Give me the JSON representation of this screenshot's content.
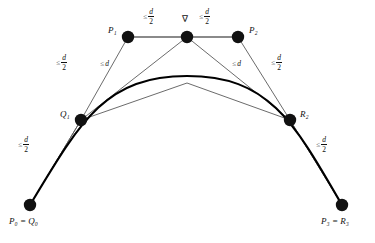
{
  "figure": {
    "kind": "bezier-subdivision-diagram",
    "background": "#ffffff",
    "stroke_thin": "#555555",
    "stroke_hull": "#8a8a8a",
    "stroke_curve": "#000000",
    "node_fill": "#111111",
    "width": 375,
    "height": 243
  },
  "points": [
    {
      "id": "P0Q0",
      "label": "P",
      "sub": "0",
      "label2": "Q",
      "sub2": "0",
      "text": "P₀ = Q₀",
      "x": 30,
      "y": 205,
      "r": 6.2,
      "label_pos": "below"
    },
    {
      "id": "Q1",
      "label": "Q",
      "sub": "1",
      "text": "Q₁",
      "x": 81,
      "y": 120,
      "r": 6.2,
      "label_pos": "left"
    },
    {
      "id": "P1",
      "label": "P",
      "sub": "1",
      "text": "P₁",
      "x": 128,
      "y": 37,
      "r": 6.2,
      "label_pos": "left"
    },
    {
      "id": "APEX",
      "label": "∇",
      "sub": "",
      "text": "∇",
      "x": 187,
      "y": 37,
      "r": 6.2,
      "label_pos": "above"
    },
    {
      "id": "P2",
      "label": "P",
      "sub": "2",
      "text": "P₂",
      "x": 238,
      "y": 37,
      "r": 6.2,
      "label_pos": "right"
    },
    {
      "id": "R2",
      "label": "R",
      "sub": "2",
      "text": "R₂",
      "x": 290,
      "y": 120,
      "r": 6.2,
      "label_pos": "right"
    },
    {
      "id": "P3R3",
      "label": "P",
      "sub": "3",
      "label2": "R",
      "sub2": "3",
      "text": "P₃ = R₃",
      "x": 342,
      "y": 205,
      "r": 6.2,
      "label_pos": "below"
    }
  ],
  "point_labels": {
    "p0q0": "P₀ = Q₀",
    "q1": "Q₁",
    "p1": "P₁",
    "apex": "∇",
    "p2": "P₂",
    "r2": "R₂",
    "p3r3": "P₃ = R₃"
  },
  "measures": [
    {
      "id": "m-p1-apex",
      "relation": "≤",
      "numerator": "d",
      "denominator": "2",
      "form": "fraction",
      "text": "≤ d/2",
      "x": 148,
      "y": 14
    },
    {
      "id": "m-apex-p2",
      "relation": "≤",
      "numerator": "d",
      "denominator": "2",
      "form": "fraction",
      "text": "≤ d/2",
      "x": 203,
      "y": 14
    },
    {
      "id": "m-q1-p1",
      "relation": "≤",
      "numerator": "d",
      "denominator": "2",
      "form": "fraction",
      "text": "≤ d/2",
      "x": 91,
      "y": 59
    },
    {
      "id": "m-q1-apex",
      "relation": "≤",
      "numerator": "d",
      "denominator": "",
      "form": "plain",
      "text": "≤ d",
      "x": 126,
      "y": 62
    },
    {
      "id": "m-apex-r2",
      "relation": "≤",
      "numerator": "d",
      "denominator": "",
      "form": "plain",
      "text": "≤ d",
      "x": 235,
      "y": 62
    },
    {
      "id": "m-p2-r2",
      "relation": "≤",
      "numerator": "d",
      "denominator": "2",
      "form": "fraction",
      "text": "≤ d/2",
      "x": 273,
      "y": 59
    },
    {
      "id": "m-p0-q1",
      "relation": "≤",
      "numerator": "d",
      "denominator": "2",
      "form": "fraction",
      "text": "≤ d/2",
      "x": 28,
      "y": 140
    },
    {
      "id": "m-r2-p3",
      "relation": "≤",
      "numerator": "d",
      "denominator": "2",
      "form": "fraction",
      "text": "≤ d/2",
      "x": 322,
      "y": 140
    }
  ],
  "segments": [
    {
      "id": "seg-p1-apex",
      "from": "P1",
      "to": "APEX",
      "style": "hull"
    },
    {
      "id": "seg-apex-p2",
      "from": "APEX",
      "to": "P2",
      "style": "hull"
    },
    {
      "id": "seg-q1-p1",
      "from": "Q1",
      "to": "P1",
      "style": "thin"
    },
    {
      "id": "seg-q1-apex",
      "from": "Q1",
      "to": "APEX",
      "style": "thin"
    },
    {
      "id": "seg-apex-r2",
      "from": "APEX",
      "to": "R2",
      "style": "thin"
    },
    {
      "id": "seg-p2-r2",
      "from": "P2",
      "to": "R2",
      "style": "thin"
    },
    {
      "id": "seg-p0-q1",
      "from": "P0Q0",
      "to": "Q1",
      "style": "thin"
    },
    {
      "id": "seg-r2-p3",
      "from": "R2",
      "to": "P3R3",
      "style": "thin"
    }
  ],
  "curves": [
    {
      "id": "inner-polyline",
      "desc": "thin subdivided control polygon arc",
      "path": "M30,205 L81,120 L187,83 L290,120 L342,205",
      "style": "thin"
    },
    {
      "id": "bezier-curve",
      "desc": "thick cubic Bezier curve",
      "path": "M30,205 C81,120 106,75 187,75 C268,75 293,120 342,205",
      "style": "curve"
    }
  ]
}
